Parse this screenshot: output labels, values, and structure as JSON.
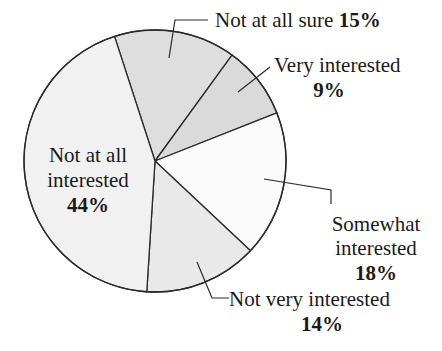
{
  "chart_data": {
    "type": "pie",
    "title": "",
    "unit": "%",
    "slices": [
      {
        "label": "Not at all sure",
        "value": 15,
        "color": "#dedede"
      },
      {
        "label": "Very interested",
        "value": 9,
        "color": "#dadada"
      },
      {
        "label": "Somewhat interested",
        "value": 18,
        "color": "#fbfbfb"
      },
      {
        "label": "Not very interested",
        "value": 14,
        "color": "#e9e9e9"
      },
      {
        "label": "Not at all interested",
        "value": 44,
        "color": "#f1f1f1"
      }
    ],
    "categories": [
      "Not at all sure",
      "Very interested",
      "Somewhat interested",
      "Not very interested",
      "Not at all interested"
    ],
    "values": [
      15,
      9,
      18,
      14,
      44
    ],
    "legend": "none (direct labels with leader lines)",
    "start_angle_deg": -18,
    "direction": "clockwise"
  },
  "labels": {
    "not_at_all_sure": {
      "line1": "Not at all sure",
      "pct": "15%"
    },
    "very_interested": {
      "line1": "Very interested",
      "pct": "9%"
    },
    "somewhat_interested": {
      "line1": "Somewhat",
      "line2": "interested",
      "pct": "18%"
    },
    "not_very_interested": {
      "line1": "Not very interested",
      "pct": "14%"
    },
    "not_at_all_interested": {
      "line1": "Not at all",
      "line2": "interested",
      "pct": "44%"
    }
  }
}
